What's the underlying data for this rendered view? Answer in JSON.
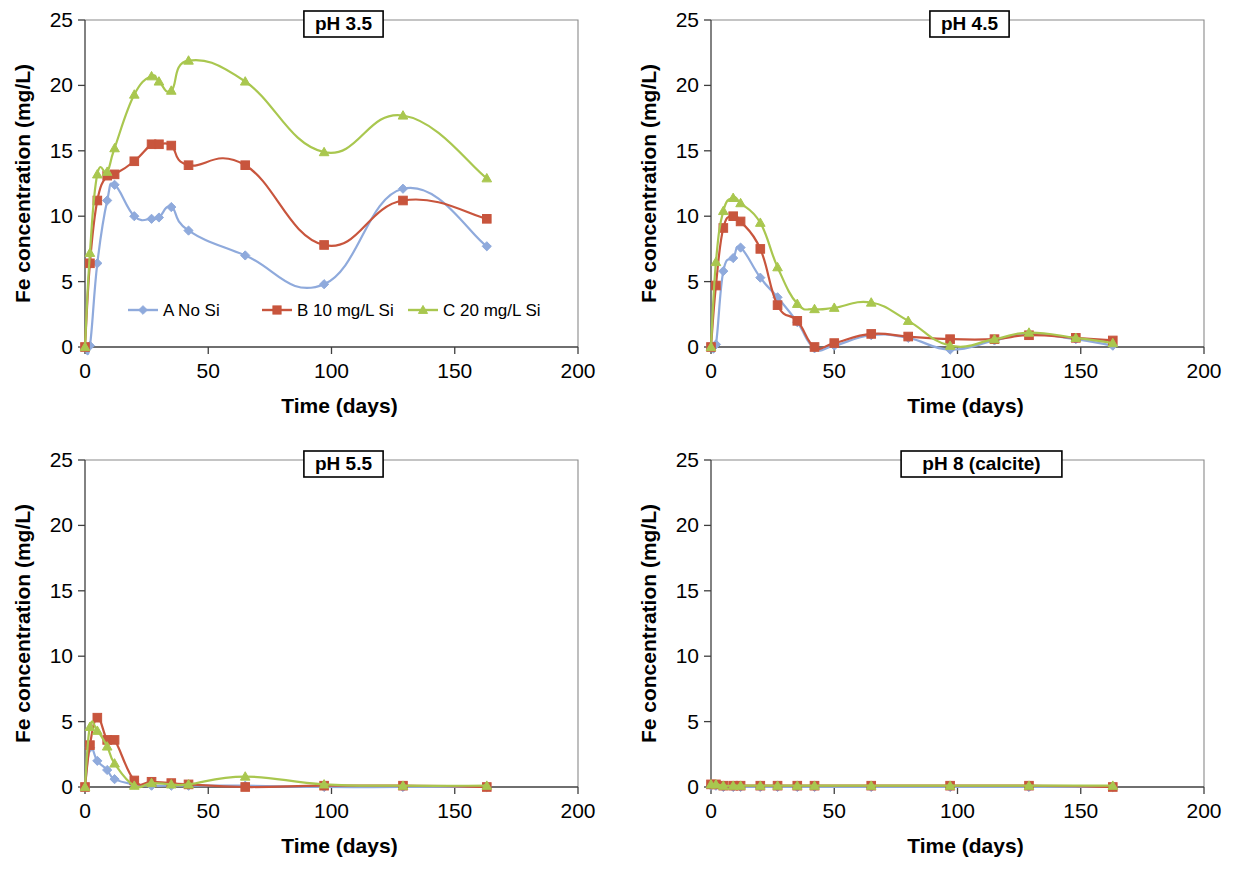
{
  "figure": {
    "axis": {
      "x_label": "Time (days)",
      "y_label": "Fe concentration (mg/L)",
      "x_ticks": [
        "0",
        "50",
        "100",
        "150",
        "200"
      ],
      "y_ticks": [
        "0",
        "5",
        "10",
        "15",
        "20",
        "25"
      ],
      "xlim": [
        0,
        200
      ],
      "ylim": [
        0,
        25
      ]
    },
    "legend": {
      "position": "inside-panel-1-lower-left",
      "entries": [
        {
          "label": "A No Si",
          "color": "#8faadc",
          "marker": "diamond"
        },
        {
          "label": "B 10 mg/L Si",
          "color": "#c8553d",
          "marker": "square"
        },
        {
          "label": "C 20 mg/L Si",
          "color": "#a9c74f",
          "marker": "triangle"
        }
      ]
    },
    "panel_titles": [
      "pH 3.5",
      "pH 4.5",
      "pH 5.5",
      "pH 8 (calcite)"
    ]
  },
  "chart_data": [
    {
      "type": "line",
      "title": "pH 3.5",
      "xlabel": "Time (days)",
      "ylabel": "Fe concentration (mg/L)",
      "xlim": [
        0,
        200
      ],
      "ylim": [
        0,
        25
      ],
      "grid": false,
      "x": [
        0,
        2,
        5,
        9,
        12,
        20,
        27,
        30,
        35,
        42,
        65,
        97,
        129,
        163
      ],
      "series": [
        {
          "name": "A No Si",
          "color": "#8faadc",
          "marker": "diamond",
          "values": [
            0.0,
            0.1,
            6.4,
            11.2,
            12.4,
            10.0,
            9.8,
            9.9,
            10.7,
            8.9,
            7.0,
            4.8,
            12.1,
            7.7
          ]
        },
        {
          "name": "B 10 mg/L Si",
          "color": "#c8553d",
          "marker": "square",
          "values": [
            0.0,
            6.4,
            11.2,
            13.1,
            13.2,
            14.2,
            15.5,
            15.5,
            15.4,
            13.9,
            13.9,
            7.8,
            11.2,
            9.8
          ]
        },
        {
          "name": "C 20 mg/L Si",
          "color": "#a9c74f",
          "marker": "triangle",
          "values": [
            0.0,
            7.2,
            13.2,
            13.4,
            15.2,
            19.3,
            20.7,
            20.3,
            19.6,
            21.9,
            20.3,
            14.9,
            17.7,
            12.9
          ]
        }
      ]
    },
    {
      "type": "line",
      "title": "pH 4.5",
      "xlabel": "Time (days)",
      "ylabel": "Fe concentration (mg/L)",
      "xlim": [
        0,
        200
      ],
      "ylim": [
        0,
        25
      ],
      "grid": false,
      "x": [
        0,
        2,
        5,
        9,
        12,
        20,
        27,
        35,
        42,
        50,
        65,
        80,
        97,
        115,
        129,
        148,
        163
      ],
      "series": [
        {
          "name": "A No Si",
          "color": "#8faadc",
          "marker": "diamond",
          "values": [
            0.0,
            0.2,
            5.8,
            6.8,
            7.6,
            5.3,
            3.8,
            1.9,
            -0.1,
            0.1,
            0.9,
            0.7,
            -0.2,
            0.5,
            1.0,
            0.6,
            0.1
          ]
        },
        {
          "name": "B 10 mg/L Si",
          "color": "#c8553d",
          "marker": "square",
          "values": [
            0.0,
            4.7,
            9.1,
            10.0,
            9.6,
            7.5,
            3.2,
            2.0,
            0.0,
            0.3,
            1.0,
            0.8,
            0.6,
            0.6,
            0.9,
            0.7,
            0.5
          ]
        },
        {
          "name": "C 20 mg/L Si",
          "color": "#a9c74f",
          "marker": "triangle",
          "values": [
            0.0,
            6.5,
            10.4,
            11.4,
            11.0,
            9.5,
            6.1,
            3.3,
            2.9,
            3.0,
            3.4,
            2.0,
            0.1,
            0.6,
            1.1,
            0.7,
            0.3
          ]
        }
      ]
    },
    {
      "type": "line",
      "title": "pH 5.5",
      "xlabel": "Time (days)",
      "ylabel": "Fe concentration (mg/L)",
      "xlim": [
        0,
        200
      ],
      "ylim": [
        0,
        25
      ],
      "grid": false,
      "x": [
        0,
        2,
        5,
        9,
        12,
        20,
        27,
        35,
        42,
        65,
        97,
        129,
        163
      ],
      "series": [
        {
          "name": "A No Si",
          "color": "#8faadc",
          "marker": "diamond",
          "values": [
            0.0,
            3.0,
            2.0,
            1.3,
            0.6,
            0.2,
            0.1,
            0.1,
            0.1,
            0.1,
            0.0,
            0.0,
            0.0
          ]
        },
        {
          "name": "B 10 mg/L Si",
          "color": "#c8553d",
          "marker": "square",
          "values": [
            0.0,
            3.2,
            5.3,
            3.6,
            3.6,
            0.5,
            0.4,
            0.3,
            0.2,
            0.0,
            0.1,
            0.1,
            0.0
          ]
        },
        {
          "name": "C 20 mg/L Si",
          "color": "#a9c74f",
          "marker": "triangle",
          "values": [
            0.0,
            4.6,
            4.3,
            3.1,
            1.8,
            0.1,
            0.3,
            0.2,
            0.2,
            0.8,
            0.2,
            0.1,
            0.1
          ]
        }
      ]
    },
    {
      "type": "line",
      "title": "pH 8 (calcite)",
      "xlabel": "Time (days)",
      "ylabel": "Fe concentration (mg/L)",
      "xlim": [
        0,
        200
      ],
      "ylim": [
        0,
        25
      ],
      "grid": false,
      "x": [
        0,
        2,
        5,
        9,
        12,
        20,
        27,
        35,
        42,
        65,
        97,
        129,
        163
      ],
      "series": [
        {
          "name": "A No Si",
          "color": "#8faadc",
          "marker": "diamond",
          "values": [
            0.1,
            0.1,
            0.0,
            0.0,
            0.0,
            0.0,
            0.0,
            0.0,
            0.0,
            0.0,
            0.0,
            0.0,
            0.0
          ]
        },
        {
          "name": "B 10 mg/L Si",
          "color": "#c8553d",
          "marker": "square",
          "values": [
            0.2,
            0.2,
            0.1,
            0.1,
            0.1,
            0.1,
            0.1,
            0.1,
            0.1,
            0.1,
            0.1,
            0.1,
            0.0
          ]
        },
        {
          "name": "C 20 mg/L Si",
          "color": "#a9c74f",
          "marker": "triangle",
          "values": [
            0.2,
            0.2,
            0.1,
            0.1,
            0.1,
            0.1,
            0.1,
            0.1,
            0.1,
            0.1,
            0.1,
            0.1,
            0.1
          ]
        }
      ]
    }
  ]
}
